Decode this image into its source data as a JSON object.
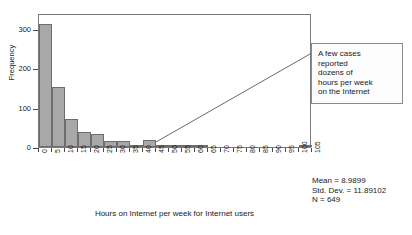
{
  "chart_data": {
    "type": "bar",
    "title": "",
    "subtitle": "",
    "xlabel": "Hours on Internet per week for Internet users",
    "ylabel": "Frequency",
    "xlim": [
      0,
      105
    ],
    "ylim": [
      0,
      340
    ],
    "grid": false,
    "legend": "none",
    "bin_width": 5,
    "x_ticks": [
      "0",
      "5",
      "10",
      "15",
      "20",
      "25",
      "30",
      "35",
      "40",
      "45",
      "50",
      "55",
      "60",
      "65",
      "70",
      "75",
      "80",
      "85",
      "90",
      "95",
      "100",
      "105"
    ],
    "y_ticks": [
      "0",
      "100",
      "200",
      "300"
    ],
    "y_tick_values": [
      0,
      100,
      200,
      300
    ],
    "categories": [
      "0-5",
      "5-10",
      "10-15",
      "15-20",
      "20-25",
      "25-30",
      "30-35",
      "35-40",
      "40-45",
      "45-50",
      "50-55",
      "55-60",
      "60-65",
      "65-70",
      "70-75",
      "75-80",
      "80-85",
      "85-90",
      "90-95",
      "95-100",
      "100-105"
    ],
    "bin_starts": [
      0,
      5,
      10,
      15,
      20,
      25,
      30,
      35,
      40,
      45,
      50,
      55,
      60,
      65,
      70,
      75,
      80,
      85,
      90,
      95,
      100
    ],
    "values": [
      312,
      152,
      72,
      37,
      33,
      14,
      15,
      6,
      17,
      2,
      3,
      2,
      3,
      0,
      0,
      0,
      0,
      0,
      0,
      0,
      1
    ],
    "annotations": [
      {
        "name": "tail-callout",
        "text": "A few cases reported dozens of hours per week on the Internet",
        "points_to_x": 47,
        "points_to_y": 8
      }
    ]
  },
  "axes": {
    "y_title": "Frequency",
    "x_title": "Hours on Internet per week for Internet users"
  },
  "callout": {
    "line1": "A few cases",
    "line2": "reported",
    "line3": "dozens of",
    "line4": "hours per week",
    "line5": "on the Internet"
  },
  "stats": {
    "mean": "Mean = 8.9899",
    "std_dev": "Std. Dev. = 11.89102",
    "n": "N = 649"
  },
  "colors": {
    "bar_fill": "#a8a8a8",
    "bar_edge": "#6d6d6d",
    "frame": "#7a7a7a",
    "text": "#1a1a1a",
    "callout_border": "#8a8a8a"
  }
}
